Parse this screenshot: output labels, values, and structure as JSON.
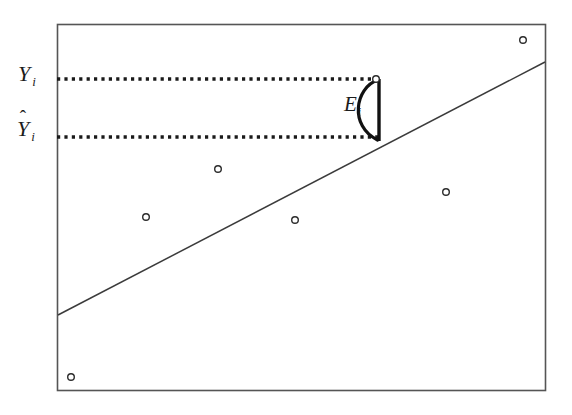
{
  "figure": {
    "caption_labels": {
      "observed_value": {
        "symbol": "Y",
        "subscript": "i",
        "accent": "none"
      },
      "fitted_value": {
        "symbol": "Y",
        "subscript": "i",
        "accent": "hat",
        "accent_glyph": "ˆ"
      },
      "residual": {
        "symbol": "E",
        "subscript": "i",
        "accent": "none"
      }
    },
    "colors": {
      "background": "#ffffff",
      "frame": "#555555",
      "regression_line": "#3b3b3b",
      "dotted_guide": "#1a1a1a",
      "point_stroke": "#2b2b2b",
      "brace": "#111111"
    }
  },
  "chart_data": {
    "type": "scatter",
    "title": "",
    "xlabel": "",
    "ylabel": "",
    "grid": false,
    "legend": "none",
    "xlim": [
      57,
      545
    ],
    "ylim": [
      390,
      24
    ],
    "axis_ticks": {
      "x": [],
      "y": []
    },
    "points": [
      {
        "id": "p1",
        "x": 376,
        "y": 79,
        "label": "Y_i",
        "highlighted": true
      },
      {
        "id": "p2",
        "x": 523,
        "y": 40,
        "label": "",
        "highlighted": false
      },
      {
        "id": "p3",
        "x": 218,
        "y": 169,
        "label": "",
        "highlighted": false
      },
      {
        "id": "p4",
        "x": 146,
        "y": 217,
        "label": "",
        "highlighted": false
      },
      {
        "id": "p5",
        "x": 295,
        "y": 220,
        "label": "",
        "highlighted": false
      },
      {
        "id": "p6",
        "x": 446,
        "y": 192,
        "label": "",
        "highlighted": false
      },
      {
        "id": "p7",
        "x": 71,
        "y": 377,
        "label": "",
        "highlighted": false
      }
    ],
    "fit_line": {
      "name": "regression line",
      "x1": 58,
      "y1": 315,
      "x2": 545,
      "y2": 62
    },
    "guides": [
      {
        "name": "observed-guide",
        "orientation": "horizontal",
        "y": 79,
        "x_from": 57,
        "x_to": 378,
        "style": "dotted",
        "label": "Y_i"
      },
      {
        "name": "fitted-guide",
        "orientation": "horizontal",
        "y": 137,
        "x_from": 57,
        "x_to": 378,
        "style": "dotted",
        "label": "Yhat_i"
      }
    ],
    "residual_marker": {
      "name": "residual-brace",
      "x": 379,
      "y_top": 79,
      "y_bottom": 140,
      "label": "E_i"
    },
    "frame": {
      "left": 57,
      "top": 24,
      "right": 545,
      "bottom": 390
    }
  }
}
